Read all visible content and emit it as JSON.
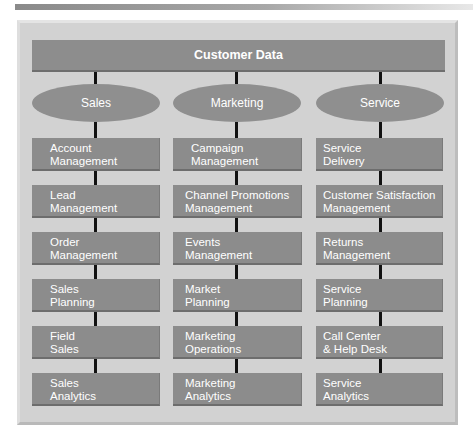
{
  "diagram": {
    "header": {
      "label": "Customer Data"
    },
    "columns": [
      {
        "label": "Sales",
        "items": [
          {
            "line1": "Account",
            "line2": "Management"
          },
          {
            "line1": "Lead",
            "line2": "Management"
          },
          {
            "line1": "Order",
            "line2": "Management"
          },
          {
            "line1": "Sales",
            "line2": "Planning"
          },
          {
            "line1": "Field",
            "line2": "Sales"
          },
          {
            "line1": "Sales",
            "line2": "Analytics"
          }
        ]
      },
      {
        "label": "Marketing",
        "items": [
          {
            "line1": "Campaign",
            "line2": "Management"
          },
          {
            "line1": "Channel Promotions",
            "line2": "Management"
          },
          {
            "line1": "Events",
            "line2": "Management"
          },
          {
            "line1": "Market",
            "line2": "Planning"
          },
          {
            "line1": "Marketing",
            "line2": "Operations"
          },
          {
            "line1": "Marketing",
            "line2": "Analytics"
          }
        ]
      },
      {
        "label": "Service",
        "items": [
          {
            "line1": "Service",
            "line2": "Delivery"
          },
          {
            "line1": "Customer Satisfaction",
            "line2": "Management"
          },
          {
            "line1": "Returns",
            "line2": "Management"
          },
          {
            "line1": "Service",
            "line2": "Planning"
          },
          {
            "line1": "Call Center",
            "line2": "& Help Desk"
          },
          {
            "line1": "Service",
            "line2": "Analytics"
          }
        ]
      }
    ],
    "colors": {
      "panel": "#d2d2d2",
      "box": "#8c8c8c",
      "text": "#ffffff",
      "connector": "#111111"
    }
  }
}
